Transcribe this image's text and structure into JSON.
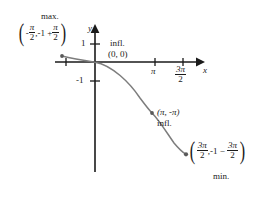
{
  "figure": {
    "kind": "calculus-curve-graph",
    "axes": {
      "x_axis_label": "x",
      "y_axis_label": "y",
      "y_ticks": [
        {
          "label": "1",
          "value": 1
        },
        {
          "label": "-1",
          "value": -1
        }
      ],
      "x_ticks": [
        {
          "label_pi": "π",
          "value": 3.1416,
          "fraction": false
        },
        {
          "label_num": "3π",
          "label_den": "2",
          "value": 4.7124,
          "fraction": true
        }
      ]
    },
    "annotations": {
      "max": {
        "caption": "max.",
        "open_paren": "(",
        "close_paren": ")",
        "x_sign": "-",
        "x_num": "π",
        "x_den": "2",
        "comma": ",",
        "y_lead": "-1 +",
        "y_num": "π",
        "y_den": "2"
      },
      "inflection_origin": {
        "caption": "infl.",
        "point": "(0, 0)"
      },
      "inflection_pi": {
        "point": "(π, -π)",
        "caption": "infl."
      },
      "min": {
        "caption": "min.",
        "open_paren": "(",
        "close_paren": ")",
        "x_num": "3π",
        "x_den": "2",
        "comma": ",",
        "y_lead": "-1",
        "y_minus": "−",
        "y_num": "3π",
        "y_den": "2"
      }
    },
    "colors": {
      "axis": "#1a1a1a",
      "curve": "#7d7d7d",
      "point": "#5a5a5a",
      "text": "#1a1a1a"
    }
  }
}
